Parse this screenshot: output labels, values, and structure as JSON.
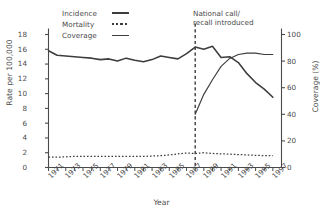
{
  "chart_data": {
    "type": "line",
    "title": "",
    "xlabel": "Year",
    "ylabel": "Rate per 100,000",
    "ylabel_right": "Coverage (%)",
    "ylim": [
      0,
      18
    ],
    "ylim_right": [
      0,
      100
    ],
    "xlim": [
      1971,
      1998
    ],
    "grid": false,
    "legend_position": "top-left",
    "yticks": [
      "0",
      "2",
      "4",
      "6",
      "8",
      "10",
      "12",
      "14",
      "16",
      "18"
    ],
    "yticks_right": [
      "0",
      "20",
      "40",
      "60",
      "80",
      "100"
    ],
    "xticks": [
      "1971",
      "1973",
      "1975",
      "1977",
      "1979",
      "1981",
      "1983",
      "1985",
      "1987",
      "1989",
      "1991",
      "1993",
      "1995",
      "1997"
    ],
    "x": [
      1971,
      1972,
      1973,
      1974,
      1975,
      1976,
      1977,
      1978,
      1979,
      1980,
      1981,
      1982,
      1983,
      1984,
      1985,
      1986,
      1987,
      1988,
      1989,
      1990,
      1991,
      1992,
      1993,
      1994,
      1995,
      1996,
      1997
    ],
    "annotations": [
      {
        "text_line1": "National call/",
        "text_line2": "recall introduced",
        "x": 1988,
        "style": "vertical-dashed-line"
      }
    ],
    "series": [
      {
        "name": "Incidence",
        "axis": "left",
        "style": "solid-thick",
        "color": "#3d3d3d",
        "units": "Rate per 100,000",
        "values": [
          15.8,
          15.2,
          15.1,
          15.0,
          14.9,
          14.8,
          14.6,
          14.7,
          14.4,
          14.8,
          14.5,
          14.3,
          14.6,
          15.1,
          14.9,
          14.7,
          15.4,
          16.3,
          16.0,
          16.4,
          14.9,
          15.0,
          14.2,
          12.7,
          11.5,
          10.6,
          9.5
        ]
      },
      {
        "name": "Mortality",
        "axis": "left",
        "style": "dotted",
        "color": "#3d3d3d",
        "units": "Rate per 100,000",
        "values": [
          1.4,
          1.4,
          1.45,
          1.5,
          1.5,
          1.5,
          1.5,
          1.5,
          1.5,
          1.5,
          1.5,
          1.5,
          1.55,
          1.6,
          1.7,
          1.85,
          1.95,
          1.9,
          2.0,
          1.9,
          1.85,
          1.8,
          1.75,
          1.7,
          1.65,
          1.6,
          1.6
        ]
      },
      {
        "name": "Coverage",
        "axis": "right",
        "style": "solid-thin",
        "color": "#3d3d3d",
        "units": "Coverage (%)",
        "x_start": 1988,
        "values_right": [
          40,
          55,
          66,
          76,
          82,
          85,
          86,
          86,
          85,
          85
        ]
      }
    ]
  },
  "legend": {
    "items": [
      {
        "label": "Incidence",
        "key": "solid-thick"
      },
      {
        "label": "Mortality",
        "key": "dotted"
      },
      {
        "label": "Coverage",
        "key": "solid-thin"
      }
    ]
  },
  "axes": {
    "left_title": "Rate per 100,000",
    "right_title": "Coverage (%)",
    "bottom_title": "Year"
  },
  "annotation": {
    "line1": "National call/",
    "line2": "recall introduced"
  }
}
